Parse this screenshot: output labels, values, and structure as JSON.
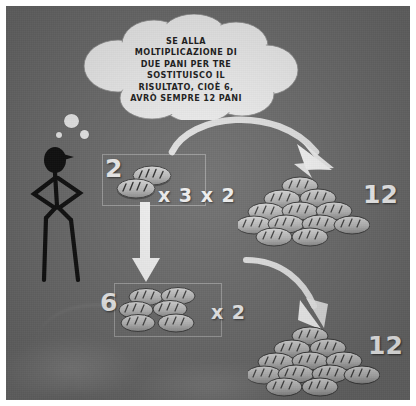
{
  "scene": {
    "background_color": "#6e6e6e",
    "frame_color": "#ffffff",
    "alt_description": "Comic panel explaining multiplication substitution with loaves of bread"
  },
  "thought_bubble": {
    "name": "thought-bubble",
    "text": "SE ALLA\nMOLTIPLICAZIONE DI\nDUE PANI PER TRE\nSOSTITUISCO IL\nRISULTATO, CIOÈ 6,\nAVRÒ SEMPRE 12 PANI",
    "fill_color": "#f4f4f4",
    "text_color": "#1b1b1b",
    "tail_dots": 3
  },
  "character": {
    "name": "stick-figure-thinking",
    "color": "#0d0d0d",
    "pose": "hands-on-hips",
    "has_cap": true
  },
  "rows": [
    {
      "id": "row-top",
      "group_label": "2",
      "group_bread_count": 2,
      "operator_label": "x 3 x 2",
      "result_label": "12",
      "result_bread_count": 12
    },
    {
      "id": "row-bottom",
      "group_label": "6",
      "group_bread_count": 6,
      "operator_label": "x 2",
      "result_label": "12",
      "result_bread_count": 12
    }
  ],
  "arrows": [
    {
      "name": "arrow-top-curve",
      "direction": "right-down",
      "color": "#f5f5f5"
    },
    {
      "name": "arrow-vertical",
      "direction": "down",
      "color": "#f7f7f7"
    },
    {
      "name": "arrow-bottom-curve",
      "direction": "right-down",
      "color": "#f5f5f5"
    }
  ],
  "colors": {
    "bread_light": "#d6d6d6",
    "bread_mid": "#b3b3b3",
    "bread_dark": "#5c5c5c",
    "number_white": "#f5f5f5",
    "background_gray": "#6e6e6e"
  }
}
